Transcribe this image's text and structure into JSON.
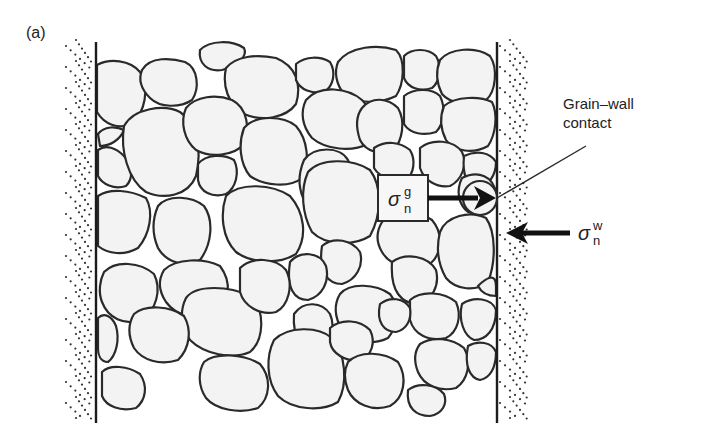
{
  "figure": {
    "panel_label": "(a)",
    "contact_label_line1": "Grain–wall",
    "contact_label_line2": "contact",
    "grain_stress_symbol": "σ",
    "grain_stress_sup": "g",
    "grain_stress_sub": "n",
    "wall_stress_symbol": "σ",
    "wall_stress_sup": "w",
    "wall_stress_sub": "n"
  },
  "colors": {
    "grain_fill": "#f3f3f3",
    "outline": "#2a2a2a",
    "background": "#ffffff"
  }
}
